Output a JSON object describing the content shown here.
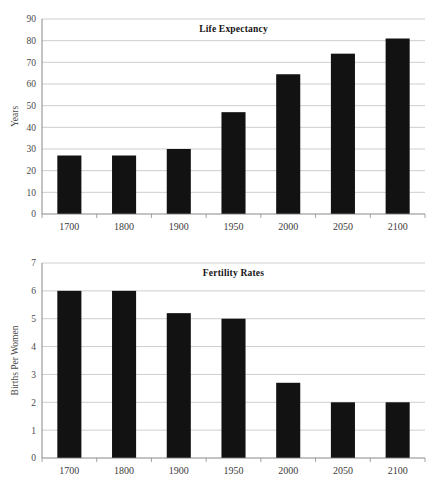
{
  "charts": [
    {
      "id": "life-expectancy",
      "title": "Life Expectancy",
      "ylabel": "Years",
      "xlabel": "",
      "categories": [
        "1700",
        "1800",
        "1900",
        "1950",
        "2000",
        "2050",
        "2100"
      ],
      "values": [
        27,
        27,
        30,
        47,
        64.5,
        74,
        81
      ],
      "yticks": [
        "0",
        "10",
        "20",
        "30",
        "40",
        "50",
        "60",
        "70",
        "80",
        "90"
      ],
      "ylim": [
        0,
        90
      ],
      "bar_color": "#121212",
      "grid_color": "#b9b9b9"
    },
    {
      "id": "fertility-rates",
      "title": "Fertility Rates",
      "ylabel": "Births Per Women",
      "xlabel": "",
      "categories": [
        "1700",
        "1800",
        "1900",
        "1950",
        "2000",
        "2050",
        "2100"
      ],
      "values": [
        6,
        6,
        5.2,
        5,
        2.7,
        2,
        2
      ],
      "yticks": [
        "0",
        "1",
        "2",
        "3",
        "4",
        "5",
        "6",
        "7"
      ],
      "ylim": [
        0,
        7
      ],
      "bar_color": "#121212",
      "grid_color": "#b9b9b9"
    }
  ],
  "chart_data": [
    {
      "type": "bar",
      "title": "Life Expectancy",
      "xlabel": "",
      "ylabel": "Years",
      "categories": [
        "1700",
        "1800",
        "1900",
        "1950",
        "2000",
        "2050",
        "2100"
      ],
      "values": [
        27,
        27,
        30,
        47,
        64.5,
        74,
        81
      ],
      "ylim": [
        0,
        90
      ],
      "ytick_step": 10,
      "grid": "horizontal",
      "legend": "none",
      "series": [
        {
          "name": "Life Expectancy",
          "values": [
            27,
            27,
            30,
            47,
            64.5,
            74,
            81
          ]
        }
      ]
    },
    {
      "type": "bar",
      "title": "Fertility Rates",
      "xlabel": "",
      "ylabel": "Births Per Women",
      "categories": [
        "1700",
        "1800",
        "1900",
        "1950",
        "2000",
        "2050",
        "2100"
      ],
      "values": [
        6,
        6,
        5.2,
        5,
        2.7,
        2,
        2
      ],
      "ylim": [
        0,
        7
      ],
      "ytick_step": 1,
      "grid": "horizontal",
      "legend": "none",
      "series": [
        {
          "name": "Births Per Women",
          "values": [
            6,
            6,
            5.2,
            5,
            2.7,
            2,
            2
          ]
        }
      ]
    }
  ]
}
